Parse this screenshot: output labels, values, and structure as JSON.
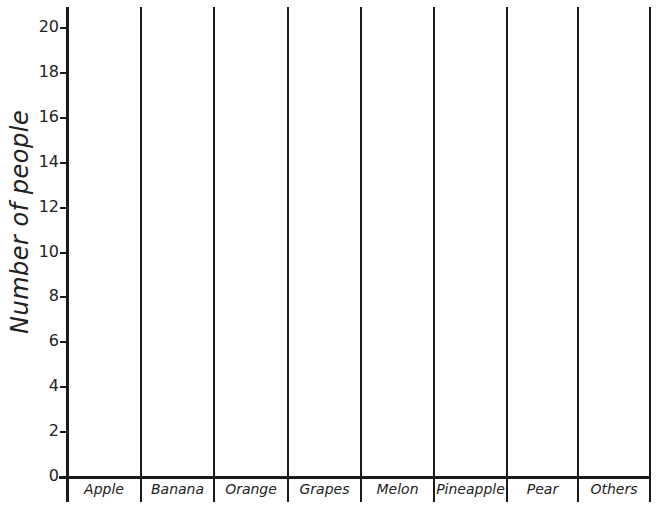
{
  "chart_data": {
    "type": "bar",
    "title": "",
    "xlabel": "",
    "ylabel": "Number of people",
    "categories": [
      "Apple",
      "Banana",
      "Orange",
      "Grapes",
      "Melon",
      "Pineapple",
      "Pear",
      "Others"
    ],
    "values": [
      null,
      null,
      null,
      null,
      null,
      null,
      null,
      null
    ],
    "yticks": [
      0,
      2,
      4,
      6,
      8,
      10,
      12,
      14,
      16,
      18,
      20
    ],
    "ylim": [
      0,
      20
    ],
    "grid": false,
    "legend": null,
    "note": "Blank bar chart template; no bars drawn"
  },
  "axis": {
    "ylabel": "Number of people",
    "ytick_labels": [
      "0",
      "2",
      "4",
      "6",
      "8",
      "10",
      "12",
      "14",
      "16",
      "18",
      "20"
    ]
  },
  "categories": [
    "Apple",
    "Banana",
    "Orange",
    "Grapes",
    "Melon",
    "Pineapple",
    "Pear",
    "Others"
  ],
  "colors": {
    "line": "#1a1a1a",
    "background": "#ffffff"
  }
}
